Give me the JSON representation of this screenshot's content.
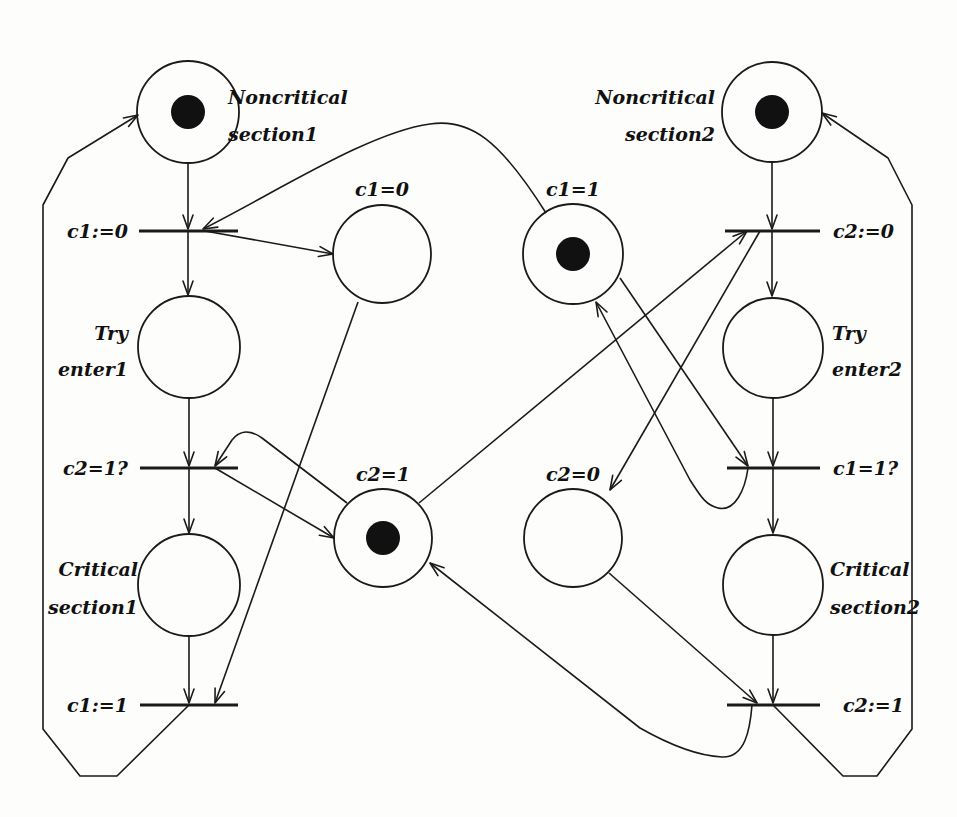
{
  "diagram": {
    "stroke_color": "#1a1a1a",
    "token_color": "#111111",
    "places": [
      {
        "id": "nc1",
        "label_lines": [
          "Noncritical",
          "section1"
        ],
        "cx": 188,
        "cy": 112,
        "r": 51,
        "tokens": 1,
        "label_x": 228,
        "label_y": [
          104,
          141
        ],
        "anchor": "start"
      },
      {
        "id": "try1",
        "label_lines": [
          "Try",
          "enter1"
        ],
        "cx": 189,
        "cy": 347,
        "r": 51,
        "tokens": 0,
        "label_x": 128,
        "label_y": [
          340,
          376
        ],
        "anchor": "end"
      },
      {
        "id": "cs1",
        "label_lines": [
          "Critical",
          "section1"
        ],
        "cx": 189,
        "cy": 585,
        "r": 51,
        "tokens": 0,
        "label_x": 138,
        "label_y": [
          576,
          614
        ],
        "anchor": "end"
      },
      {
        "id": "c1_0",
        "label_lines": [
          "c1=0"
        ],
        "cx": 382,
        "cy": 254,
        "r": 49,
        "tokens": 0,
        "label_x": 382,
        "label_y": [
          196
        ],
        "anchor": "middle"
      },
      {
        "id": "c1_1",
        "label_lines": [
          "c1=1"
        ],
        "cx": 573,
        "cy": 254,
        "r": 50,
        "tokens": 1,
        "label_x": 573,
        "label_y": [
          196
        ],
        "anchor": "middle"
      },
      {
        "id": "c2_1",
        "label_lines": [
          "c2=1"
        ],
        "cx": 383,
        "cy": 538,
        "r": 49,
        "tokens": 1,
        "label_x": 383,
        "label_y": [
          481
        ],
        "anchor": "middle"
      },
      {
        "id": "c2_0",
        "label_lines": [
          "c2=0"
        ],
        "cx": 573,
        "cy": 538,
        "r": 49,
        "tokens": 0,
        "label_x": 573,
        "label_y": [
          481
        ],
        "anchor": "middle"
      },
      {
        "id": "nc2",
        "label_lines": [
          "Noncritical",
          "section2"
        ],
        "cx": 772,
        "cy": 112,
        "r": 50,
        "tokens": 1,
        "label_x": 715,
        "label_y": [
          104,
          141
        ],
        "anchor": "end"
      },
      {
        "id": "try2",
        "label_lines": [
          "Try",
          "enter2"
        ],
        "cx": 773,
        "cy": 348,
        "r": 50,
        "tokens": 0,
        "label_x": 832,
        "label_y": [
          340,
          376
        ],
        "anchor": "start"
      },
      {
        "id": "cs2",
        "label_lines": [
          "Critical",
          "section2"
        ],
        "cx": 773,
        "cy": 585,
        "r": 50,
        "tokens": 0,
        "label_x": 830,
        "label_y": [
          576,
          614
        ],
        "anchor": "start"
      }
    ],
    "transitions": [
      {
        "id": "t1",
        "label": "c1:=0",
        "x1": 139,
        "x2": 238,
        "y": 231,
        "label_x": 128,
        "anchor": "end"
      },
      {
        "id": "t2",
        "label": "c2=1?",
        "x1": 140,
        "x2": 238,
        "y": 468,
        "label_x": 128,
        "anchor": "end"
      },
      {
        "id": "t3",
        "label": "c1:=1",
        "x1": 140,
        "x2": 238,
        "y": 705,
        "label_x": 128,
        "anchor": "end"
      },
      {
        "id": "t4",
        "label": "c2:=0",
        "x1": 725,
        "x2": 820,
        "y": 231,
        "label_x": 833,
        "anchor": "start"
      },
      {
        "id": "t5",
        "label": "c1=1?",
        "x1": 727,
        "x2": 820,
        "y": 468,
        "label_x": 833,
        "anchor": "start"
      },
      {
        "id": "t6",
        "label": "c2:=1",
        "x1": 727,
        "x2": 820,
        "y": 705,
        "label_x": 843,
        "anchor": "start"
      }
    ],
    "arcs": [
      {
        "from": "nc1",
        "to": "t1",
        "d": "M188 163 L188 229",
        "arrow": [
          188,
          229,
          90
        ]
      },
      {
        "from": "t1",
        "to": "try1",
        "d": "M188 231 L188 295",
        "arrow": [
          188,
          295,
          90
        ]
      },
      {
        "from": "try1",
        "to": "t2",
        "d": "M189 398 L189 466",
        "arrow": [
          189,
          466,
          90
        ]
      },
      {
        "from": "t2",
        "to": "cs1",
        "d": "M189 468 L189 533",
        "arrow": [
          189,
          533,
          90
        ]
      },
      {
        "from": "cs1",
        "to": "t3",
        "d": "M189 636 L189 703",
        "arrow": [
          189,
          703,
          90
        ]
      },
      {
        "from": "t3",
        "to": "nc1",
        "d": "M189 705 L117 776 L80 776 L43 729 L43 205 L68 158 L138 115",
        "arrow": [
          138,
          115,
          -31
        ]
      },
      {
        "from": "t1",
        "to": "c1_0",
        "d": "M205 231 L333 254",
        "arrow": [
          333,
          254,
          10
        ]
      },
      {
        "from": "c1_1",
        "to": "t1",
        "d": "M546 213 C 500 140, 470 118, 430 124 C 370 132, 280 190, 203 229",
        "arrow": [
          203,
          229,
          153
        ]
      },
      {
        "from": "c1_0",
        "to": "t3",
        "d": "M358 302 L215 703",
        "arrow": [
          215,
          703,
          110
        ]
      },
      {
        "from": "t2",
        "to": "c2_1",
        "d": "M215 468 L334 538",
        "arrow": [
          334,
          538,
          30
        ]
      },
      {
        "from": "c2_1",
        "to": "t2",
        "d": "M347 503 L262 438 C 248 428, 238 432, 232 440 L215 466",
        "arrow": [
          215,
          466,
          122
        ]
      },
      {
        "from": "nc2",
        "to": "t4",
        "d": "M772 162 L772 229",
        "arrow": [
          772,
          229,
          90
        ]
      },
      {
        "from": "t4",
        "to": "try2",
        "d": "M772 231 L772 296",
        "arrow": [
          772,
          296,
          90
        ]
      },
      {
        "from": "try2",
        "to": "t5",
        "d": "M773 398 L773 466",
        "arrow": [
          773,
          466,
          90
        ]
      },
      {
        "from": "t5",
        "to": "cs2",
        "d": "M773 468 L773 533",
        "arrow": [
          773,
          533,
          90
        ]
      },
      {
        "from": "cs2",
        "to": "t6",
        "d": "M773 635 L773 703",
        "arrow": [
          773,
          703,
          90
        ]
      },
      {
        "from": "t6",
        "to": "nc2",
        "d": "M773 705 L843 776 L877 776 L912 729 L912 205 L888 158 L822 113",
        "arrow": [
          822,
          113,
          -146
        ]
      },
      {
        "from": "c2_1",
        "to": "t4",
        "d": "M419 503 L747 231",
        "arrow": [
          747,
          231,
          -40
        ]
      },
      {
        "from": "t4",
        "to": "c2_0",
        "d": "M760 231 L610 490",
        "arrow": [
          610,
          490,
          120
        ]
      },
      {
        "from": "c1_1",
        "to": "t5",
        "d": "M620 278 L748 466",
        "arrow": [
          748,
          466,
          56
        ]
      },
      {
        "from": "t5",
        "to": "c1_1",
        "d": "M748 468 C 745 490, 735 512, 718 508 C 705 505, 700 495, 690 480 L596 302",
        "arrow": [
          596,
          302,
          -118
        ]
      },
      {
        "from": "c2_0",
        "to": "t6",
        "d": "M609 573 L757 703",
        "arrow": [
          757,
          703,
          41
        ]
      },
      {
        "from": "t6",
        "to": "c2_1",
        "d": "M752 705 C 750 730, 745 758, 722 757 C 700 756, 670 745, 640 728 L430 563",
        "arrow": [
          430,
          563,
          -142
        ]
      }
    ]
  }
}
